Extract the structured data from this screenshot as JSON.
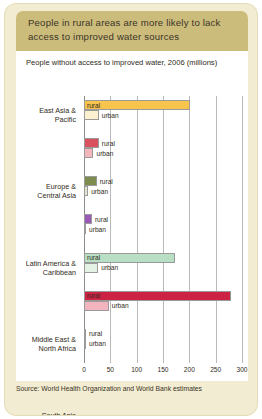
{
  "figure": {
    "header_title": "People in rural areas are more likely to lack access to improved water sources",
    "subtitle": "People without access to improved water, 2006 (millions)",
    "source": "Source: World Health Organization and World Bank estimates",
    "colors": {
      "card_background": "#f2ecd2",
      "header_band": "#ccbc7c",
      "panel": "#ffffff",
      "gridline": "#b9b9b9",
      "axis": "#8d8d8d",
      "text": "#2f2b22"
    }
  },
  "chart_data": {
    "type": "bar",
    "orientation": "horizontal",
    "title": "People without access to improved water, 2006 (millions)",
    "xlabel": "",
    "ylabel": "",
    "xlim": [
      0,
      300
    ],
    "xticks": [
      0,
      50,
      100,
      150,
      200,
      250,
      300
    ],
    "grid": true,
    "legend": "inline bar labels",
    "categories": [
      "East Asia & Pacific",
      "Europe & Central Asia",
      "Latin America & Caribbean",
      "Middle East & North Africa",
      "South Asia",
      "Sub-Saharan Africa",
      "High-income"
    ],
    "series": [
      {
        "name": "rural",
        "values": [
          201,
          28,
          24,
          15,
          173,
          279,
          3
        ],
        "colors": [
          "#f7c44e",
          "#d9505f",
          "#7e8b4e",
          "#9b59b6",
          "#b8dfc4",
          "#cc2244",
          "#7e8b4e"
        ]
      },
      {
        "name": "urban",
        "values": [
          28,
          18,
          8,
          4,
          27,
          47,
          2
        ],
        "colors": [
          "#fbf0cf",
          "#f3b6bb",
          "#e3e6cd",
          "#ffffff",
          "#e4f2e6",
          "#f2b4bf",
          "#ffffff"
        ]
      }
    ]
  },
  "bars": [
    {
      "category_line1": "East Asia &",
      "category_line2": "Pacific",
      "rural_label": "rural",
      "urban_label": "urban",
      "rural_value": 201,
      "urban_value": 28,
      "rural_color": "#f7c44e",
      "urban_color": "#fbf0cf"
    },
    {
      "category_line1": "Europe &",
      "category_line2": "Central Asia",
      "rural_label": "rural",
      "urban_label": "urban",
      "rural_value": 28,
      "urban_value": 18,
      "rural_color": "#d9505f",
      "urban_color": "#f3b6bb"
    },
    {
      "category_line1": "Latin America &",
      "category_line2": "Caribbean",
      "rural_label": "rural",
      "urban_label": "urban",
      "rural_value": 24,
      "urban_value": 8,
      "rural_color": "#7e8b4e",
      "urban_color": "#e3e6cd"
    },
    {
      "category_line1": "Middle East &",
      "category_line2": "North Africa",
      "rural_label": "rural",
      "urban_label": "urban",
      "rural_value": 15,
      "urban_value": 4,
      "rural_color": "#9b59b6",
      "urban_color": "#ffffff"
    },
    {
      "category_line1": "South Asia",
      "category_line2": "",
      "rural_label": "rural",
      "urban_label": "urban",
      "rural_value": 173,
      "urban_value": 27,
      "rural_color": "#b8dfc4",
      "urban_color": "#e4f2e6"
    },
    {
      "category_line1": "Sub-Saharan",
      "category_line2": "Africa",
      "rural_label": "rural",
      "urban_label": "urban",
      "rural_value": 279,
      "urban_value": 47,
      "rural_color": "#cc2244",
      "urban_color": "#f2b4bf"
    },
    {
      "category_line1": "High-income",
      "category_line2": "",
      "rural_label": "rural",
      "urban_label": "urban",
      "rural_value": 3,
      "urban_value": 2,
      "rural_color": "#7e8b4e",
      "urban_color": "#ffffff"
    }
  ],
  "axis": {
    "ticks": [
      "0",
      "50",
      "100",
      "150",
      "200",
      "250",
      "300"
    ]
  }
}
